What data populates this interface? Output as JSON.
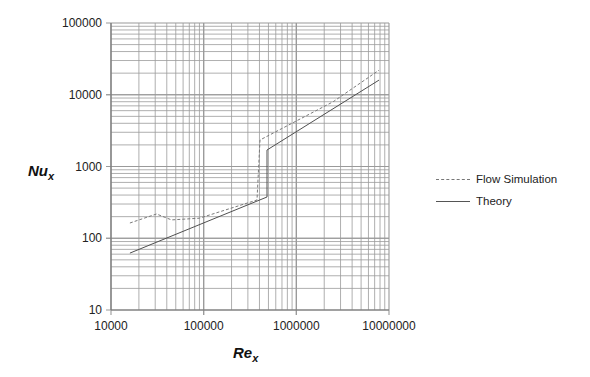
{
  "chart_data": {
    "type": "line",
    "title": "",
    "xlabel": "Re_x",
    "ylabel": "Nu_x",
    "xscale": "log",
    "yscale": "log",
    "xlim": [
      10000,
      10000000
    ],
    "ylim": [
      10,
      100000
    ],
    "grid": true,
    "legend_position": "right",
    "x_tick_labels": [
      "10000",
      "100000",
      "1000000",
      "10000000"
    ],
    "y_tick_labels": [
      "10",
      "100",
      "1000",
      "10000",
      "100000"
    ],
    "series": [
      {
        "name": "Flow Simulation",
        "style": "dashed",
        "x": [
          16000,
          31000,
          45000,
          90000,
          376000,
          405000,
          2500000,
          7800000
        ],
        "y": [
          163,
          218,
          180,
          190,
          341,
          2340,
          8000,
          22000
        ]
      },
      {
        "name": "Theory",
        "style": "solid",
        "x": [
          16000,
          482000,
          482000,
          7800000
        ],
        "y": [
          62,
          376,
          1700,
          16000
        ]
      }
    ]
  },
  "axes": {
    "x_label_main": "Re",
    "x_label_sub": "x",
    "y_label_main": "Nu",
    "y_label_sub": "x"
  },
  "legend": {
    "items": [
      {
        "label": "Flow Simulation",
        "style": "dashed"
      },
      {
        "label": "Theory",
        "style": "solid"
      }
    ]
  },
  "colors": {
    "grid": "#9a9a9a",
    "flow_simulation": "#7a7a7a",
    "theory": "#505050"
  }
}
